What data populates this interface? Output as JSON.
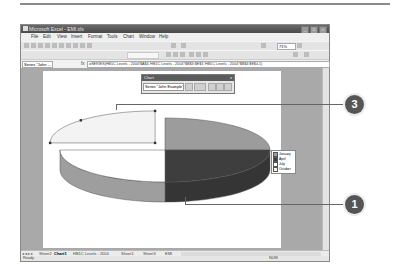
{
  "window": {
    "title": "Microsoft Excel - EMI.xls",
    "controls": [
      "minimize",
      "maximize",
      "close"
    ]
  },
  "menu": {
    "items": [
      "File",
      "Edit",
      "View",
      "Insert",
      "Format",
      "Tools",
      "Chart",
      "Window",
      "Help"
    ],
    "ask_placeholder": "Type a question for help"
  },
  "toolbar": {
    "zoom": "71%"
  },
  "formula_bar": {
    "name_box": "Series \"John ...",
    "fx": "fx",
    "formula": "=SERIES(HB1C Levels - 2004!$A$4,'HB1C Levels - 2004'!$B$3:$E$3,'HB1C Levels - 2004'!$B$4:$E$4,1)"
  },
  "chart_toolbar": {
    "title": "Chart",
    "selected_object": "Series \"John Example\" P",
    "close": "x"
  },
  "chart_data": {
    "type": "pie",
    "subtype": "3d-exploded",
    "series_name": "John Example",
    "categories": [
      "January",
      "April",
      "July",
      "October"
    ],
    "values": [
      25,
      25,
      25,
      25
    ],
    "colors": [
      "#9c9c9c",
      "#3e3e3e",
      "#ffffff",
      "#f3f3f3"
    ],
    "legend_position": "right",
    "exploded_selected": "October"
  },
  "legend": {
    "entries": [
      "January",
      "April",
      "July",
      "October"
    ]
  },
  "sheet_tabs": {
    "nav": "◂ ◂ ▸ ▸",
    "tabs": [
      "Sheet2",
      "Chart1",
      "HB1C Levels - 2004",
      "Sheet1",
      "Sheet3",
      "EMI"
    ],
    "active": "Chart1"
  },
  "status": {
    "left": "Ready",
    "right": "NUM"
  },
  "callouts": {
    "top": "3",
    "bottom": "1"
  }
}
